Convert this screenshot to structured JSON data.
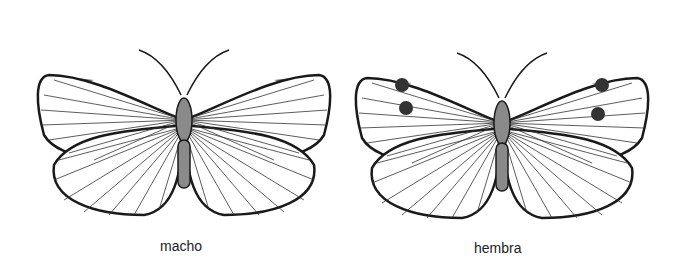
{
  "figures": [
    {
      "id": "male",
      "label": "macho",
      "has_spots": false
    },
    {
      "id": "female",
      "label": "hembra",
      "has_spots": true
    }
  ],
  "colors": {
    "outline": "#1a1a1a",
    "tip": "#6a6a6a",
    "body": "#8a8a8a",
    "wing": "#ffffff",
    "spot": "#333333"
  }
}
